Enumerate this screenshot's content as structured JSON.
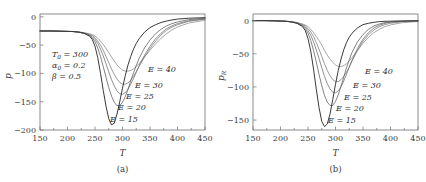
{
  "figure": {
    "panels": [
      {
        "caption": "(a)",
        "xlabel": "T",
        "ylabel_main": "p",
        "ylabel_sub": "",
        "xticks": [
          "150",
          "200",
          "250",
          "300",
          "350",
          "400",
          "450"
        ],
        "yticks": [
          "0",
          "-50",
          "-100",
          "-150",
          "-200"
        ],
        "annotations": [
          {
            "sym": "T",
            "sub": "0",
            "eq": " = 300"
          },
          {
            "sym": "α",
            "sub": "0",
            "eq": " = 0.2"
          },
          {
            "sym": "β",
            "sub": "",
            "eq": " = 0.5"
          }
        ],
        "curve_labels": [
          "E = 40",
          "E = 30",
          "E = 25",
          "E = 20",
          "E = 15"
        ]
      },
      {
        "caption": "(b)",
        "xlabel": "T",
        "ylabel_main": "p",
        "ylabel_sub": "R",
        "xticks": [
          "150",
          "200",
          "250",
          "300",
          "350",
          "400",
          "450"
        ],
        "yticks": [
          "0",
          "-50",
          "-100",
          "-150"
        ],
        "annotations": [],
        "curve_labels": [
          "E = 40",
          "E = 30",
          "E = 25",
          "E = 20",
          "E = 15"
        ]
      }
    ]
  },
  "chart_data": [
    {
      "type": "line",
      "title": "",
      "panel": "(a)",
      "xlabel": "T",
      "ylabel": "p",
      "xlim": [
        150,
        450
      ],
      "ylim": [
        -200,
        5
      ],
      "xticks": [
        150,
        200,
        250,
        300,
        350,
        400,
        450
      ],
      "yticks": [
        0,
        -50,
        -100,
        -150,
        -200
      ],
      "grid": false,
      "legend": "inline-curve-labels",
      "annotations": [
        "T_0 = 300",
        "alpha_0 = 0.2",
        "beta = 0.5"
      ],
      "x": [
        150,
        170,
        190,
        210,
        220,
        230,
        240,
        245,
        250,
        255,
        260,
        265,
        270,
        275,
        280,
        285,
        290,
        295,
        300,
        305,
        310,
        315,
        320,
        325,
        330,
        340,
        350,
        360,
        370,
        380,
        390,
        400,
        420,
        450
      ],
      "series": [
        {
          "name": "E = 15",
          "color": "#3a3a3a",
          "values": [
            -25,
            -25,
            -25.5,
            -26,
            -27,
            -29,
            -34,
            -40,
            -52,
            -72,
            -100,
            -130,
            -158,
            -180,
            -191,
            -188,
            -172,
            -150,
            -126,
            -104,
            -85,
            -70,
            -57,
            -47,
            -39,
            -27,
            -19,
            -14,
            -10,
            -7.5,
            -5.5,
            -4,
            -2.5,
            -1.5
          ]
        },
        {
          "name": "E = 20",
          "color": "#5a5a5a",
          "values": [
            -25,
            -25,
            -25.5,
            -26,
            -27,
            -29,
            -33,
            -37,
            -44,
            -55,
            -70,
            -88,
            -107,
            -125,
            -140,
            -151,
            -157,
            -157,
            -151,
            -141,
            -128,
            -113,
            -99,
            -86,
            -74,
            -55,
            -41,
            -30,
            -22,
            -16,
            -12,
            -9,
            -5,
            -2.5
          ]
        },
        {
          "name": "E = 25",
          "color": "#6a6a6a",
          "values": [
            -25,
            -25,
            -25.5,
            -26,
            -27,
            -29,
            -32,
            -35,
            -40,
            -47,
            -57,
            -69,
            -83,
            -97,
            -111,
            -122,
            -131,
            -136,
            -137,
            -134,
            -128,
            -119,
            -109,
            -98,
            -87,
            -68,
            -52,
            -39,
            -29,
            -21,
            -16,
            -12,
            -7,
            -3.5
          ]
        },
        {
          "name": "E = 30",
          "color": "#7a7a7a",
          "values": [
            -25,
            -25,
            -25.5,
            -26,
            -27,
            -28.5,
            -31,
            -33,
            -37,
            -43,
            -50,
            -59,
            -70,
            -81,
            -92,
            -102,
            -110,
            -116,
            -119,
            -119,
            -117,
            -112,
            -105,
            -97,
            -88,
            -71,
            -56,
            -43,
            -32,
            -24,
            -18,
            -14,
            -8,
            -4
          ]
        },
        {
          "name": "E = 40",
          "color": "#8a8a8a",
          "values": [
            -25,
            -25,
            -25.5,
            -26,
            -26.5,
            -28,
            -30,
            -31.5,
            -34,
            -38,
            -43,
            -49,
            -56,
            -63,
            -71,
            -78,
            -85,
            -90,
            -94,
            -96,
            -96,
            -95,
            -92,
            -88,
            -83,
            -71,
            -59,
            -48,
            -38,
            -30,
            -23,
            -18,
            -11,
            -6
          ]
        }
      ]
    },
    {
      "type": "line",
      "title": "",
      "panel": "(b)",
      "xlabel": "T",
      "ylabel": "p_R",
      "xlim": [
        150,
        450
      ],
      "ylim": [
        -165,
        10
      ],
      "xticks": [
        150,
        200,
        250,
        300,
        350,
        400,
        450
      ],
      "yticks": [
        0,
        -50,
        -100,
        -150
      ],
      "grid": false,
      "legend": "inline-curve-labels",
      "annotations": [],
      "x": [
        150,
        170,
        190,
        210,
        220,
        230,
        240,
        245,
        250,
        255,
        260,
        265,
        270,
        275,
        280,
        285,
        290,
        295,
        300,
        305,
        310,
        315,
        320,
        325,
        330,
        340,
        350,
        360,
        370,
        380,
        390,
        400,
        420,
        450
      ],
      "series": [
        {
          "name": "E = 15",
          "color": "#3a3a3a",
          "values": [
            0,
            0,
            -0.3,
            -1,
            -2,
            -4,
            -9,
            -15,
            -27,
            -46,
            -73,
            -103,
            -131,
            -152,
            -160,
            -156,
            -141,
            -119,
            -96,
            -75,
            -58,
            -44,
            -33,
            -25,
            -19,
            -11,
            -6,
            -4,
            -2.5,
            -1.5,
            -1,
            -0.8,
            -0.4,
            -0.2
          ]
        },
        {
          "name": "E = 20",
          "color": "#5a5a5a",
          "values": [
            0,
            0,
            -0.3,
            -1,
            -2,
            -4,
            -8,
            -12,
            -19,
            -30,
            -45,
            -62,
            -81,
            -98,
            -113,
            -123,
            -128,
            -128,
            -122,
            -112,
            -99,
            -85,
            -71,
            -59,
            -48,
            -32,
            -21,
            -13,
            -8,
            -5,
            -3,
            -2,
            -1,
            -0.4
          ]
        },
        {
          "name": "E = 25",
          "color": "#6a6a6a",
          "values": [
            0,
            0,
            -0.3,
            -1,
            -2,
            -3.5,
            -7,
            -10,
            -15,
            -22,
            -32,
            -44,
            -57,
            -71,
            -84,
            -95,
            -103,
            -108,
            -109,
            -106,
            -100,
            -91,
            -81,
            -70,
            -60,
            -42,
            -28,
            -18,
            -11,
            -7,
            -4,
            -2.5,
            -1.2,
            -0.5
          ]
        },
        {
          "name": "E = 30",
          "color": "#7a7a7a",
          "values": [
            0,
            0,
            -0.3,
            -1,
            -1.8,
            -3,
            -6,
            -8,
            -12,
            -17,
            -24,
            -33,
            -43,
            -54,
            -65,
            -75,
            -83,
            -89,
            -92,
            -92,
            -89,
            -84,
            -78,
            -70,
            -61,
            -45,
            -31,
            -21,
            -14,
            -9,
            -6,
            -4,
            -1.8,
            -0.7
          ]
        },
        {
          "name": "E = 40",
          "color": "#8a8a8a",
          "values": [
            0,
            0,
            -0.3,
            -0.9,
            -1.6,
            -2.7,
            -5,
            -6.5,
            -9,
            -13,
            -18,
            -24,
            -30,
            -37,
            -45,
            -52,
            -58,
            -63,
            -67,
            -69,
            -69,
            -68,
            -65,
            -61,
            -56,
            -45,
            -34,
            -25,
            -18,
            -13,
            -9,
            -6.5,
            -3.2,
            -1.3
          ]
        }
      ]
    }
  ]
}
